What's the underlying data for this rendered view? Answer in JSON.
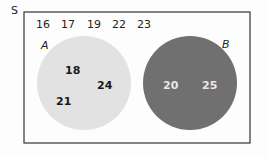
{
  "diagram": {
    "type": "venn",
    "universal_label": "S",
    "outside_elements": [
      "16",
      "17",
      "19",
      "22",
      "23"
    ],
    "sets": [
      {
        "label": "A",
        "elements": [
          "18",
          "24",
          "21"
        ],
        "fill": "#e2e2e2"
      },
      {
        "label": "B",
        "elements": [
          "20",
          "25"
        ],
        "fill": "#707070"
      }
    ],
    "overlap": false
  }
}
